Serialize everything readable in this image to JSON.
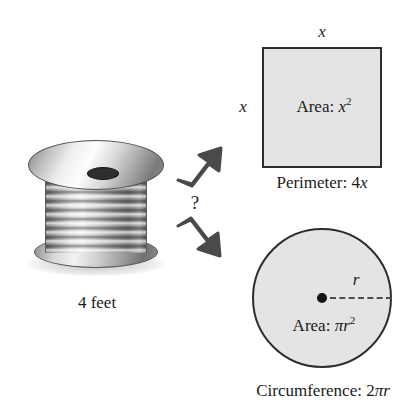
{
  "figure": {
    "type": "math-illustration",
    "topic": "Comparing a square and a circle formed from a fixed length of wire",
    "source_object": {
      "name": "spool-of-wire",
      "caption": "4 feet"
    },
    "transition": {
      "question_mark": "?",
      "arrows": [
        {
          "name": "arrow-up-right",
          "direction": "up-right"
        },
        {
          "name": "arrow-down-right",
          "direction": "down-right"
        }
      ]
    },
    "square": {
      "side_label_top": "x",
      "side_label_left": "x",
      "area_prefix": "Area: ",
      "area_base": "x",
      "area_exponent": "2",
      "perimeter_prefix": "Perimeter: ",
      "perimeter_value": "4",
      "perimeter_variable": "x",
      "fill_color": "#e4e4e4",
      "stroke_color": "#2d2d2d"
    },
    "circle": {
      "radius_label": "r",
      "area_prefix": "Area: ",
      "area_pi": "π",
      "area_base": "r",
      "area_exponent": "2",
      "circumference_prefix": "Circumference: ",
      "circumference_value": "2",
      "circumference_pi": "π",
      "circumference_variable": "r",
      "fill_color": "#e4e4e4",
      "stroke_color": "#2d2d2d"
    }
  }
}
